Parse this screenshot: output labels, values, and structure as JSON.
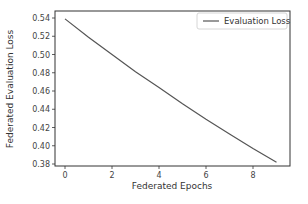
{
  "chart_data": {
    "type": "line",
    "title": "",
    "xlabel": "Federated Epochs",
    "ylabel": "Federated Evaluation Loss",
    "x": [
      0,
      1,
      2,
      3,
      4,
      5,
      6,
      7,
      8,
      9
    ],
    "series": [
      {
        "name": "Evaluation Loss",
        "values": [
          0.539,
          0.519,
          0.5,
          0.481,
          0.464,
          0.446,
          0.429,
          0.413,
          0.397,
          0.382
        ],
        "color": "#555555"
      }
    ],
    "xticks": [
      "0",
      "2",
      "4",
      "6",
      "8"
    ],
    "yticks": [
      "0.38",
      "0.40",
      "0.42",
      "0.44",
      "0.46",
      "0.48",
      "0.50",
      "0.52",
      "0.54"
    ],
    "xlim": [
      -0.45,
      9.45
    ],
    "ylim": [
      0.374,
      0.548
    ],
    "grid": false,
    "legend_position": "upper right"
  }
}
